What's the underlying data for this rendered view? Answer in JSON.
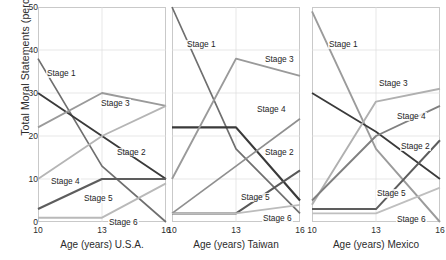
{
  "chart_data": {
    "type": "line",
    "title": "",
    "xlabel": "Age (years)",
    "ylabel": "Total Moral Statements (percent)",
    "x": [
      10,
      13,
      16
    ],
    "xticklabels": [
      "10",
      "13",
      "16"
    ],
    "yticklabels": [
      "0",
      "10",
      "20",
      "30",
      "40",
      "50"
    ],
    "yticks": [
      0,
      10,
      20,
      30,
      40,
      50
    ],
    "ylim": [
      0,
      50
    ],
    "xlim": [
      10,
      16
    ],
    "grid": true,
    "legend_position": "inline-labels",
    "panels": [
      {
        "name": "U.S.A.",
        "xcaption": "Age (years) U.S.A.",
        "series": [
          {
            "name": "Stage 1",
            "values": [
              38,
              13,
              0
            ],
            "color": "#6f6f6f",
            "width": 1.7,
            "label_x": 8,
            "label_y": 62
          },
          {
            "name": "Stage 2",
            "values": [
              30,
              20,
              10
            ],
            "color": "#3a3a3a",
            "width": 1.9,
            "label_x": 78,
            "label_y": 141
          },
          {
            "name": "Stage 3",
            "values": [
              22,
              30,
              27
            ],
            "color": "#9a9a9a",
            "width": 1.8,
            "label_x": 62,
            "label_y": 92
          },
          {
            "name": "Stage 4",
            "values": [
              10,
              20,
              27
            ],
            "color": "#b5b5b5",
            "width": 1.8,
            "label_x": 12,
            "label_y": 170
          },
          {
            "name": "Stage 5",
            "values": [
              3,
              10,
              10
            ],
            "color": "#5d5d5d",
            "width": 2.2,
            "label_x": 45,
            "label_y": 187
          },
          {
            "name": "Stage 6",
            "values": [
              1,
              1,
              9
            ],
            "color": "#b9b9b9",
            "width": 1.9,
            "label_x": 70,
            "label_y": 211
          }
        ]
      },
      {
        "name": "Taiwan",
        "xcaption": "Age (years)  Taiwan",
        "series": [
          {
            "name": "Stage 1",
            "values": [
              50,
              17,
              2
            ],
            "color": "#6f6f6f",
            "width": 1.7,
            "label_x": 14,
            "label_y": 33
          },
          {
            "name": "Stage 2",
            "values": [
              22,
              22,
              5
            ],
            "color": "#3a3a3a",
            "width": 2.2,
            "label_x": 92,
            "label_y": 141
          },
          {
            "name": "Stage 3",
            "values": [
              10,
              38,
              34
            ],
            "color": "#9a9a9a",
            "width": 1.9,
            "label_x": 92,
            "label_y": 48
          },
          {
            "name": "Stage 4",
            "values": [
              2,
              13,
              24
            ],
            "color": "#8f8f8f",
            "width": 1.7,
            "label_x": 84,
            "label_y": 98
          },
          {
            "name": "Stage 5",
            "values": [
              2,
              2,
              12
            ],
            "color": "#595959",
            "width": 2.0,
            "label_x": 68,
            "label_y": 186
          },
          {
            "name": "Stage 6",
            "values": [
              2,
              2,
              4
            ],
            "color": "#bcbcbc",
            "width": 1.7,
            "label_x": 90,
            "label_y": 207
          }
        ]
      },
      {
        "name": "Mexico",
        "xcaption": "Age (years)  Mexico",
        "series": [
          {
            "name": "Stage 1",
            "values": [
              49,
              17,
              0
            ],
            "color": "#9b9b9b",
            "width": 1.9,
            "label_x": 16,
            "label_y": 33
          },
          {
            "name": "Stage 2",
            "values": [
              30,
              21,
              10
            ],
            "color": "#3a3a3a",
            "width": 1.8,
            "label_x": 88,
            "label_y": 135
          },
          {
            "name": "Stage 3",
            "values": [
              4,
              28,
              31
            ],
            "color": "#b0b0b0",
            "width": 1.9,
            "label_x": 66,
            "label_y": 72
          },
          {
            "name": "Stage 4",
            "values": [
              5,
              20,
              27
            ],
            "color": "#808080",
            "width": 1.9,
            "label_x": 84,
            "label_y": 105
          },
          {
            "name": "Stage 5",
            "values": [
              3,
              3,
              19
            ],
            "color": "#5d5d5d",
            "width": 2.0,
            "label_x": 64,
            "label_y": 182
          },
          {
            "name": "Stage 6",
            "values": [
              2,
              2,
              8
            ],
            "color": "#bfbfbf",
            "width": 1.8,
            "label_x": 84,
            "label_y": 208
          }
        ]
      }
    ]
  }
}
